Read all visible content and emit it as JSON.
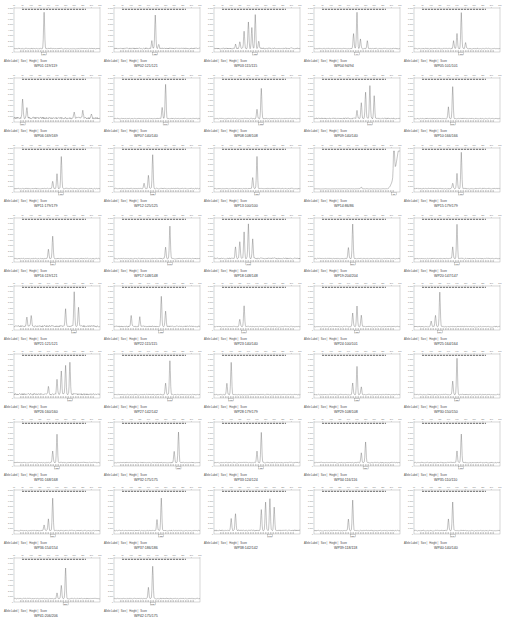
{
  "legend_labels": [
    "Allele Label",
    "Size",
    "Height",
    "Score"
  ],
  "chart_data": {
    "type": "line",
    "title": "",
    "layout": {
      "columns": 5,
      "rows": 9,
      "panel_count": 42
    },
    "y_ticks_default": [
      "0",
      "1,000",
      "2,000",
      "3,000",
      "4,000",
      "5,000",
      "6,000",
      "7,000",
      "8,000"
    ],
    "panels": [
      {
        "label": "WP01:119/119",
        "allele": "119",
        "peaks": [
          [
            0.35,
            0.95
          ]
        ],
        "noise": 0.02
      },
      {
        "label": "WP02:121/121",
        "allele": "121",
        "peaks": [
          [
            0.48,
            0.88
          ],
          [
            0.44,
            0.2
          ],
          [
            0.52,
            0.12
          ]
        ],
        "noise": 0.03
      },
      {
        "label": "WP03:115/115",
        "allele": "115",
        "peaks": [
          [
            0.25,
            0.1
          ],
          [
            0.3,
            0.18
          ],
          [
            0.35,
            0.45
          ],
          [
            0.4,
            0.7
          ],
          [
            0.44,
            0.55
          ],
          [
            0.48,
            0.9
          ],
          [
            0.52,
            0.2
          ]
        ],
        "noise": 0.03
      },
      {
        "label": "WP04:94/94",
        "allele": "94",
        "peaks": [
          [
            0.5,
            0.95
          ],
          [
            0.46,
            0.4
          ],
          [
            0.54,
            0.25
          ],
          [
            0.62,
            0.2
          ]
        ],
        "noise": 0.02
      },
      {
        "label": "WP05:101/101",
        "allele": "101",
        "peaks": [
          [
            0.55,
            0.95
          ],
          [
            0.5,
            0.4
          ],
          [
            0.46,
            0.2
          ],
          [
            0.6,
            0.15
          ]
        ],
        "noise": 0.02
      },
      {
        "label": "WP06:169/169",
        "allele": "169",
        "peaks": [
          [
            0.1,
            0.5
          ],
          [
            0.15,
            0.3
          ],
          [
            0.7,
            0.15
          ],
          [
            0.8,
            0.2
          ],
          [
            0.9,
            0.12
          ]
        ],
        "noise": 0.05
      },
      {
        "label": "WP07:140/140",
        "allele": "140",
        "peaks": [
          [
            0.6,
            0.9
          ],
          [
            0.56,
            0.3
          ]
        ],
        "noise": 0.02
      },
      {
        "label": "WP08:108/108",
        "allele": "108",
        "peaks": [
          [
            0.55,
            0.8
          ],
          [
            0.5,
            0.25
          ]
        ],
        "noise": 0.02
      },
      {
        "label": "WP09:140/140",
        "allele": "140",
        "peaks": [
          [
            0.55,
            0.4
          ],
          [
            0.6,
            0.7
          ],
          [
            0.65,
            0.85
          ],
          [
            0.7,
            0.6
          ],
          [
            0.5,
            0.2
          ]
        ],
        "noise": 0.03
      },
      {
        "label": "WP10:166/166",
        "allele": "166",
        "peaks": [
          [
            0.45,
            0.85
          ],
          [
            0.4,
            0.3
          ]
        ],
        "noise": 0.02
      },
      {
        "label": "WP11:179/179",
        "allele": "179",
        "peaks": [
          [
            0.55,
            0.85
          ],
          [
            0.5,
            0.4
          ],
          [
            0.45,
            0.2
          ]
        ],
        "noise": 0.02
      },
      {
        "label": "WP12:125/125",
        "allele": "125",
        "peaks": [
          [
            0.45,
            0.9
          ],
          [
            0.4,
            0.35
          ],
          [
            0.35,
            0.15
          ]
        ],
        "noise": 0.02
      },
      {
        "label": "WP13:100/100",
        "allele": "100",
        "peaks": [
          [
            0.5,
            0.85
          ],
          [
            0.45,
            0.3
          ]
        ],
        "noise": 0.02
      },
      {
        "label": "WP14:86/86",
        "allele": "86",
        "peaks": [
          [
            0.93,
            0.95
          ],
          [
            0.55,
            0.05
          ]
        ],
        "noise": 0.01,
        "rising_end": true
      },
      {
        "label": "WP15:179/179",
        "allele": "179",
        "peaks": [
          [
            0.55,
            0.95
          ],
          [
            0.5,
            0.4
          ],
          [
            0.45,
            0.15
          ]
        ],
        "noise": 0.02
      },
      {
        "label": "WP16:119/121",
        "allele": "119/121",
        "peaks": [
          [
            0.45,
            0.6
          ],
          [
            0.4,
            0.25
          ]
        ],
        "noise": 0.02
      },
      {
        "label": "WP17:148/148",
        "allele": "148",
        "peaks": [
          [
            0.65,
            0.85
          ],
          [
            0.6,
            0.3
          ]
        ],
        "noise": 0.02
      },
      {
        "label": "WP18:148/148",
        "allele": "148",
        "peaks": [
          [
            0.25,
            0.3
          ],
          [
            0.3,
            0.45
          ],
          [
            0.35,
            0.7
          ],
          [
            0.4,
            0.9
          ],
          [
            0.45,
            0.5
          ]
        ],
        "noise": 0.03
      },
      {
        "label": "WP19:204/204",
        "allele": "204",
        "peaks": [
          [
            0.45,
            0.9
          ],
          [
            0.4,
            0.3
          ]
        ],
        "noise": 0.02
      },
      {
        "label": "WP20:147/147",
        "allele": "147",
        "peaks": [
          [
            0.5,
            0.9
          ],
          [
            0.45,
            0.3
          ]
        ],
        "noise": 0.02
      },
      {
        "label": "WP21:121/121",
        "allele": "121",
        "peaks": [
          [
            0.15,
            0.25
          ],
          [
            0.2,
            0.3
          ],
          [
            0.6,
            0.45
          ],
          [
            0.7,
            0.9
          ],
          [
            0.75,
            0.5
          ]
        ],
        "noise": 0.04
      },
      {
        "label": "WP22:115/115",
        "allele": "115",
        "peaks": [
          [
            0.2,
            0.3
          ],
          [
            0.3,
            0.25
          ],
          [
            0.55,
            0.8
          ],
          [
            0.6,
            0.4
          ]
        ],
        "noise": 0.03
      },
      {
        "label": "WP23:140/140",
        "allele": "140",
        "peaks": [
          [
            0.35,
            0.55
          ],
          [
            0.3,
            0.2
          ]
        ],
        "noise": 0.02
      },
      {
        "label": "WP24:100/101",
        "allele": "100/101",
        "peaks": [
          [
            0.45,
            0.35
          ],
          [
            0.5,
            0.55
          ],
          [
            0.55,
            0.3
          ]
        ],
        "noise": 0.02
      },
      {
        "label": "WP25:164/164",
        "allele": "164",
        "peaks": [
          [
            0.3,
            0.9
          ],
          [
            0.25,
            0.3
          ],
          [
            0.2,
            0.15
          ]
        ],
        "noise": 0.02
      },
      {
        "label": "WP26:160/160",
        "allele": "160",
        "peaks": [
          [
            0.5,
            0.4
          ],
          [
            0.55,
            0.6
          ],
          [
            0.6,
            0.75
          ],
          [
            0.65,
            0.85
          ],
          [
            0.4,
            0.2
          ]
        ],
        "noise": 0.04
      },
      {
        "label": "WP27:142/142",
        "allele": "142",
        "peaks": [
          [
            0.65,
            0.9
          ],
          [
            0.6,
            0.3
          ]
        ],
        "noise": 0.02
      },
      {
        "label": "WP28:179/179",
        "allele": "179",
        "peaks": [
          [
            0.2,
            0.85
          ],
          [
            0.15,
            0.3
          ]
        ],
        "noise": 0.02
      },
      {
        "label": "WP29:108/108",
        "allele": "108",
        "peaks": [
          [
            0.5,
            0.75
          ],
          [
            0.45,
            0.3
          ],
          [
            0.55,
            0.2
          ]
        ],
        "noise": 0.02
      },
      {
        "label": "WP30:150/150",
        "allele": "150",
        "peaks": [
          [
            0.5,
            0.95
          ],
          [
            0.45,
            0.35
          ]
        ],
        "noise": 0.02
      },
      {
        "label": "WP31:168/168",
        "allele": "168",
        "peaks": [
          [
            0.5,
            0.75
          ],
          [
            0.45,
            0.3
          ]
        ],
        "noise": 0.02
      },
      {
        "label": "WP32:175/175",
        "allele": "175",
        "peaks": [
          [
            0.75,
            0.8
          ],
          [
            0.7,
            0.3
          ]
        ],
        "noise": 0.02
      },
      {
        "label": "WP33:124/124",
        "allele": "124",
        "peaks": [
          [
            0.55,
            0.8
          ],
          [
            0.5,
            0.3
          ]
        ],
        "noise": 0.02
      },
      {
        "label": "WP34:116/116",
        "allele": "116",
        "peaks": [
          [
            0.6,
            0.55
          ],
          [
            0.55,
            0.25
          ]
        ],
        "noise": 0.02
      },
      {
        "label": "WP35:110/110",
        "allele": "110",
        "peaks": [
          [
            0.55,
            0.75
          ],
          [
            0.5,
            0.3
          ]
        ],
        "noise": 0.02
      },
      {
        "label": "WP36:154/154",
        "allele": "154",
        "peaks": [
          [
            0.45,
            0.85
          ],
          [
            0.4,
            0.3
          ],
          [
            0.35,
            0.15
          ]
        ],
        "noise": 0.02
      },
      {
        "label": "WP37:186/186",
        "allele": "186",
        "peaks": [
          [
            0.55,
            0.85
          ],
          [
            0.5,
            0.3
          ]
        ],
        "noise": 0.02
      },
      {
        "label": "WP38:142/142",
        "allele": "142",
        "peaks": [
          [
            0.2,
            0.3
          ],
          [
            0.25,
            0.45
          ],
          [
            0.55,
            0.55
          ],
          [
            0.6,
            0.75
          ],
          [
            0.65,
            0.85
          ],
          [
            0.7,
            0.6
          ]
        ],
        "noise": 0.03
      },
      {
        "label": "WP39:118/118",
        "allele": "118",
        "peaks": [
          [
            0.45,
            0.8
          ],
          [
            0.4,
            0.3
          ]
        ],
        "noise": 0.02
      },
      {
        "label": "WP40:140/140",
        "allele": "140",
        "peaks": [
          [
            0.45,
            0.75
          ],
          [
            0.4,
            0.3
          ]
        ],
        "noise": 0.02
      },
      {
        "label": "WP41:206/206",
        "allele": "206",
        "peaks": [
          [
            0.6,
            0.8
          ],
          [
            0.55,
            0.35
          ],
          [
            0.5,
            0.15
          ]
        ],
        "noise": 0.02
      },
      {
        "label": "WP42:175/175",
        "allele": "175",
        "peaks": [
          [
            0.45,
            0.85
          ],
          [
            0.4,
            0.3
          ]
        ],
        "noise": 0.02
      }
    ],
    "xlabel": "Size (bp)",
    "ylabel": "RFU",
    "grid": false
  }
}
